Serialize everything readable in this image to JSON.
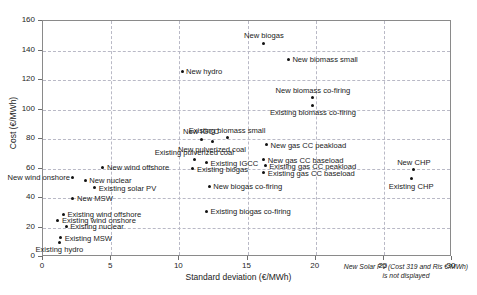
{
  "chart_data": {
    "type": "scatter",
    "title": "",
    "xlabel": "Standard deviation (€/MWh)",
    "ylabel": "Cost (€/MWh)",
    "xlim": [
      0,
      30
    ],
    "ylim": [
      0,
      160
    ],
    "xticks": [
      0,
      5,
      10,
      15,
      20,
      25,
      30
    ],
    "yticks": [
      0,
      20,
      40,
      60,
      80,
      100,
      120,
      140,
      160
    ],
    "grid": true,
    "legend": "none",
    "marker_color": "#111111",
    "points": [
      {
        "label": "New biogas",
        "x": 16.2,
        "y": 145,
        "pos": "above"
      },
      {
        "label": "New biomass small",
        "x": 18.0,
        "y": 134,
        "pos": "right"
      },
      {
        "label": "New hydro",
        "x": 10.2,
        "y": 126,
        "pos": "right"
      },
      {
        "label": "New biomass co-firing",
        "x": 19.8,
        "y": 108,
        "pos": "above"
      },
      {
        "label": "Existing biomass co-firing",
        "x": 19.8,
        "y": 103,
        "pos": "below"
      },
      {
        "label": "New IGCC",
        "x": 11.6,
        "y": 80,
        "pos": "above"
      },
      {
        "label": "New pulverized coal",
        "x": 12.4,
        "y": 78,
        "pos": "below"
      },
      {
        "label": "Existing biomass small",
        "x": 13.5,
        "y": 81,
        "pos": "above"
      },
      {
        "label": "New gas CC peakload",
        "x": 16.4,
        "y": 76,
        "pos": "right"
      },
      {
        "label": "Existing pulverized coal",
        "x": 11.1,
        "y": 66,
        "pos": "above"
      },
      {
        "label": "Existing IGCC",
        "x": 12.0,
        "y": 64,
        "pos": "right"
      },
      {
        "label": "Existing biogas",
        "x": 11.0,
        "y": 60,
        "pos": "right"
      },
      {
        "label": "New gas CC baseload",
        "x": 16.2,
        "y": 66,
        "pos": "right"
      },
      {
        "label": "Existing gas CC peakload",
        "x": 16.3,
        "y": 62,
        "pos": "right"
      },
      {
        "label": "Existing gas CC baseload",
        "x": 16.2,
        "y": 57,
        "pos": "right"
      },
      {
        "label": "New biogas co-firing",
        "x": 12.2,
        "y": 48,
        "pos": "right"
      },
      {
        "label": "Existing biogas co-firing",
        "x": 12.0,
        "y": 31,
        "pos": "right"
      },
      {
        "label": "New CHP",
        "x": 27.2,
        "y": 59,
        "pos": "above"
      },
      {
        "label": "Existing CHP",
        "x": 27.0,
        "y": 53,
        "pos": "below"
      },
      {
        "label": "New wind offshore",
        "x": 4.4,
        "y": 61,
        "pos": "right"
      },
      {
        "label": "New wind onshore",
        "x": 2.2,
        "y": 54,
        "pos": "left"
      },
      {
        "label": "New nuclear",
        "x": 3.1,
        "y": 52,
        "pos": "right"
      },
      {
        "label": "Existing solar PV",
        "x": 3.8,
        "y": 47,
        "pos": "right"
      },
      {
        "label": "New MSW",
        "x": 2.2,
        "y": 40,
        "pos": "right"
      },
      {
        "label": "Existing wind offshore",
        "x": 1.5,
        "y": 29,
        "pos": "right"
      },
      {
        "label": "Existing wind onshore",
        "x": 1.1,
        "y": 25,
        "pos": "right"
      },
      {
        "label": "Existing nuclear",
        "x": 1.7,
        "y": 21,
        "pos": "right"
      },
      {
        "label": "Existing MSW",
        "x": 1.3,
        "y": 13,
        "pos": "right"
      },
      {
        "label": "Existing hydro",
        "x": 1.2,
        "y": 10,
        "pos": "below"
      }
    ],
    "footnote": "New Solar PV (Cost 319 and Ris €/MWh) is not displayed"
  }
}
